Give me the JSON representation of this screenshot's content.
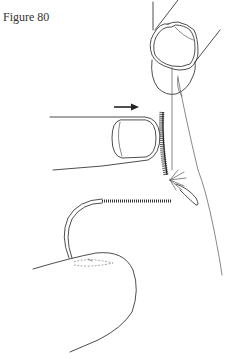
{
  "figure": {
    "caption": "Figure 80",
    "colors": {
      "ink": "#3a3a3a",
      "background": "#ffffff"
    },
    "labels": {
      "arrow": "arrow-right-icon"
    }
  }
}
